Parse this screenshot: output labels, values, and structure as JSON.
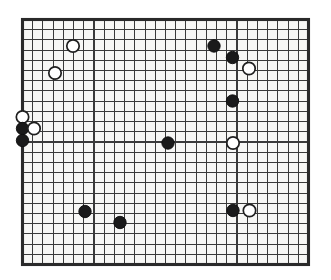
{
  "diagram": {
    "kind": "go-board-diagram",
    "board": {
      "columns": 29,
      "rows": 25,
      "left": 22.5,
      "top": 19.5,
      "right": 308.5,
      "bottom": 264.5,
      "cell_width": 10.214,
      "cell_height": 10.208,
      "background_color": "#f7f7f5",
      "line_color": "#3a3a3a",
      "border_color": "#2a2a2a",
      "border_width": 3.1,
      "line_width": 1.05,
      "page_background": "#ffffff"
    },
    "stone_style": {
      "radius": 6.2,
      "black_fill": "#1a1a1a",
      "black_stroke": "#0d0d0d",
      "white_fill": "#ffffff",
      "white_stroke": "#1f1f1f"
    },
    "counts": {
      "black": 9,
      "white": 7,
      "total": 16
    },
    "stones": [
      {
        "id": "w1",
        "color": "white",
        "col": 5,
        "row": 3,
        "cx": 73.0,
        "cy": 46.0
      },
      {
        "id": "w2",
        "color": "white",
        "col": 3,
        "row": 5,
        "cx": 55.0,
        "cy": 73.0
      },
      {
        "id": "w3",
        "color": "white",
        "col": 0,
        "row": 10,
        "cx": 22.5,
        "cy": 117.0
      },
      {
        "id": "b1",
        "color": "black",
        "col": 0,
        "row": 11,
        "cx": 22.5,
        "cy": 128.5
      },
      {
        "id": "w4",
        "color": "white",
        "col": 1,
        "row": 11,
        "cx": 34.0,
        "cy": 128.5
      },
      {
        "id": "b2",
        "color": "black",
        "col": 0,
        "row": 12,
        "cx": 22.5,
        "cy": 140.5
      },
      {
        "id": "b3",
        "color": "black",
        "col": 19,
        "row": 3,
        "cx": 214.0,
        "cy": 46.0
      },
      {
        "id": "b4",
        "color": "black",
        "col": 21,
        "row": 4,
        "cx": 232.5,
        "cy": 57.5
      },
      {
        "id": "w5",
        "color": "white",
        "col": 22,
        "row": 5,
        "cx": 249.0,
        "cy": 68.5
      },
      {
        "id": "b5",
        "color": "black",
        "col": 21,
        "row": 8,
        "cx": 232.5,
        "cy": 101.0
      },
      {
        "id": "b6",
        "color": "black",
        "col": 14,
        "row": 12,
        "cx": 168.0,
        "cy": 143.0
      },
      {
        "id": "w6",
        "color": "white",
        "col": 21,
        "row": 12,
        "cx": 233.0,
        "cy": 143.0
      },
      {
        "id": "b7",
        "color": "black",
        "col": 6,
        "row": 19,
        "cx": 85.0,
        "cy": 211.5
      },
      {
        "id": "b8",
        "color": "black",
        "col": 10,
        "row": 20,
        "cx": 120.0,
        "cy": 222.5
      },
      {
        "id": "b9",
        "color": "black",
        "col": 21,
        "row": 19,
        "cx": 233.0,
        "cy": 210.5
      },
      {
        "id": "w7",
        "color": "white",
        "col": 22,
        "row": 19,
        "cx": 249.5,
        "cy": 210.5
      }
    ]
  }
}
